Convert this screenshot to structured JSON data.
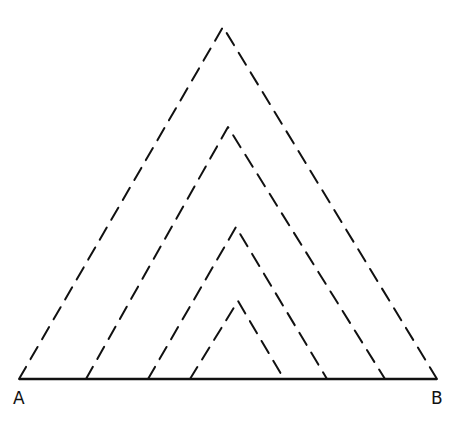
{
  "diagram": {
    "stroke_color": "#111111",
    "background": "#ffffff",
    "base_line": {
      "x1": 19,
      "y1": 379,
      "x2": 437,
      "y2": 379,
      "style": "solid"
    },
    "triangles": [
      {
        "name": "outer",
        "left": [
          19,
          379
        ],
        "apex": [
          223,
          27
        ],
        "right": [
          437,
          379
        ]
      },
      {
        "name": "second",
        "left": [
          86,
          379
        ],
        "apex": [
          228,
          127
        ],
        "right": [
          385,
          379
        ]
      },
      {
        "name": "third",
        "left": [
          148,
          379
        ],
        "apex": [
          236,
          227
        ],
        "right": [
          327,
          379
        ]
      },
      {
        "name": "inner",
        "left": [
          190,
          379
        ],
        "apex": [
          238,
          301
        ],
        "right": [
          284,
          379
        ]
      }
    ],
    "labels": {
      "A": "A",
      "B": "B"
    }
  }
}
